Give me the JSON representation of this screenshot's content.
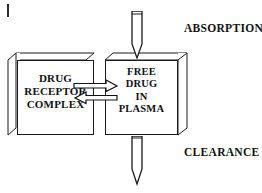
{
  "diagram": {
    "background_color": "#ffffff",
    "line_color": "#1a1a1a",
    "text_color": "#111111",
    "corner_mark": "scan-artifact-tick",
    "boxes": [
      {
        "id": "drug-receptor-complex",
        "lines": [
          "DRUG",
          "RECEPTOR",
          "COMPLEX"
        ],
        "text": "DRUG RECEPTOR COMPLEX",
        "style": "3d-box"
      },
      {
        "id": "free-drug-in-plasma",
        "lines": [
          "FREE",
          "DRUG",
          "IN",
          "PLASMA"
        ],
        "text": "FREE DRUG IN PLASMA",
        "style": "3d-box"
      }
    ],
    "flows": [
      {
        "id": "absorption",
        "label": "ABSORPTION",
        "icon": "needle-icon",
        "direction": "into-plasma",
        "position": "top"
      },
      {
        "id": "clearance",
        "label": "CLEARANCE",
        "icon": "needle-icon",
        "direction": "out-of-plasma",
        "position": "bottom"
      }
    ],
    "exchange_arrows": {
      "id": "complex-plasma-equilibrium",
      "top_arrow_direction": "right",
      "bottom_arrow_direction": "left",
      "count": 2
    }
  }
}
